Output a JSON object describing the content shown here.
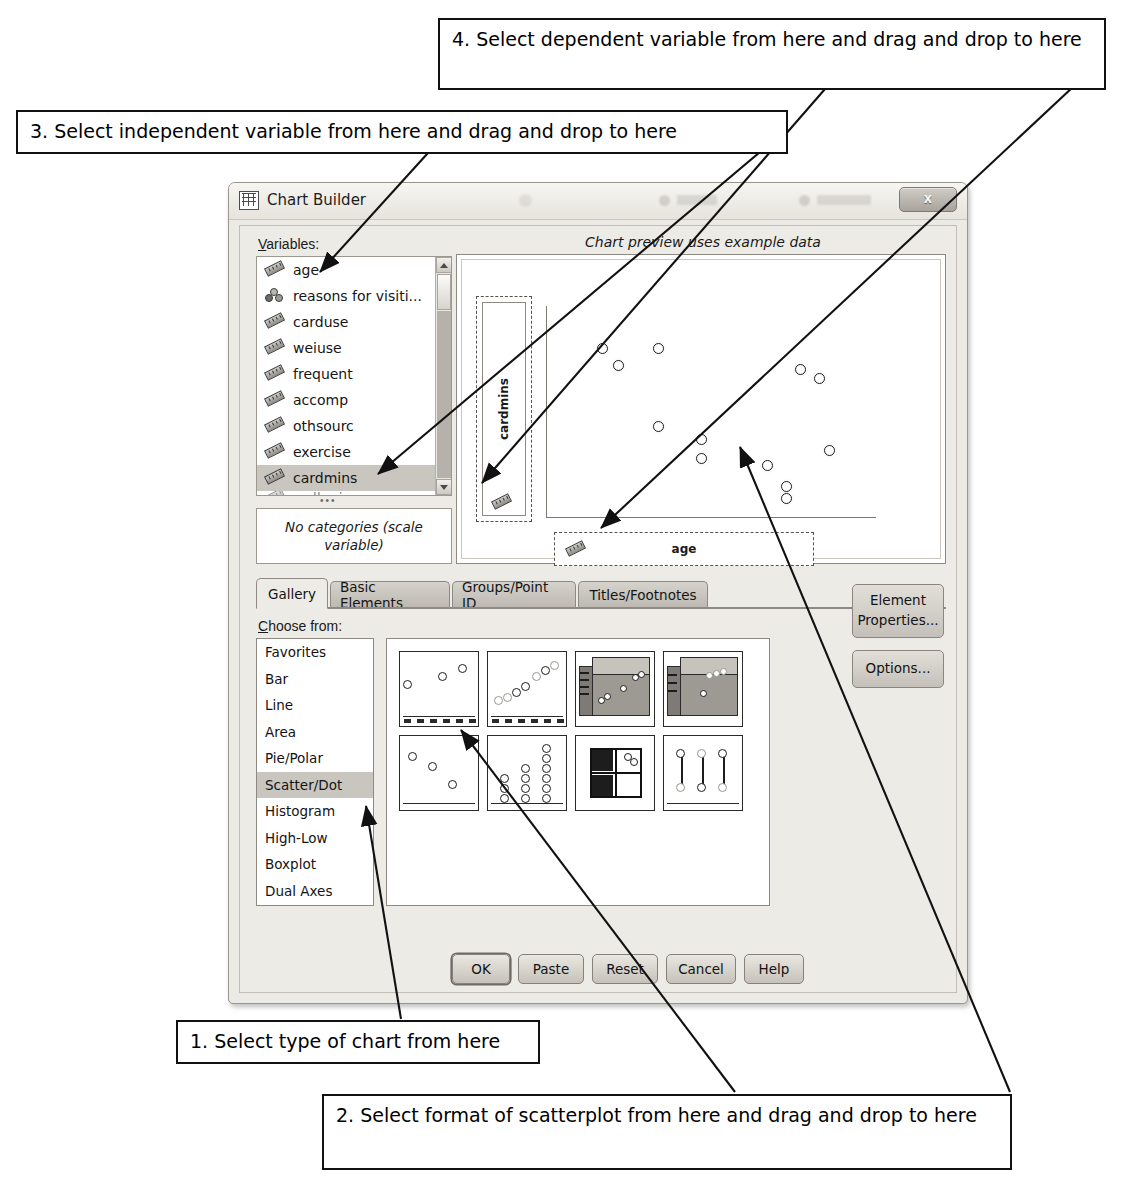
{
  "dialog": {
    "title": "Chart Builder",
    "title_icon": "grid-icon",
    "close_label": "x",
    "variables_label": "Variables:",
    "preview_caption": "Chart preview uses example data",
    "categories_note": "No categories (scale variable)",
    "choose_from_label": "Choose from:"
  },
  "variables": [
    {
      "name": "age",
      "icon": "scale-ruler-icon",
      "selected": false
    },
    {
      "name": "reasons for visiti...",
      "icon": "nominal-circles-icon",
      "selected": false
    },
    {
      "name": "carduse",
      "icon": "scale-ruler-icon",
      "selected": false
    },
    {
      "name": "weiuse",
      "icon": "scale-ruler-icon",
      "selected": false
    },
    {
      "name": "frequent",
      "icon": "scale-ruler-icon",
      "selected": false
    },
    {
      "name": "accomp",
      "icon": "scale-ruler-icon",
      "selected": false
    },
    {
      "name": "othsourc",
      "icon": "scale-ruler-icon",
      "selected": false
    },
    {
      "name": "exercise",
      "icon": "scale-ruler-icon",
      "selected": false
    },
    {
      "name": "cardmins",
      "icon": "scale-ruler-icon",
      "selected": true
    },
    {
      "name": "walkmins",
      "icon": "scale-ruler-icon",
      "selected": false
    }
  ],
  "tabs": [
    {
      "label": "Gallery",
      "active": true
    },
    {
      "label": "Basic Elements",
      "active": false
    },
    {
      "label": "Groups/Point ID",
      "active": false
    },
    {
      "label": "Titles/Footnotes",
      "active": false
    }
  ],
  "gallery_types": [
    {
      "label": "Favorites",
      "selected": false
    },
    {
      "label": "Bar",
      "selected": false
    },
    {
      "label": "Line",
      "selected": false
    },
    {
      "label": "Area",
      "selected": false
    },
    {
      "label": "Pie/Polar",
      "selected": false
    },
    {
      "label": "Scatter/Dot",
      "selected": true
    },
    {
      "label": "Histogram",
      "selected": false
    },
    {
      "label": "High-Low",
      "selected": false
    },
    {
      "label": "Boxplot",
      "selected": false
    },
    {
      "label": "Dual Axes",
      "selected": false
    }
  ],
  "gallery_thumbs": [
    {
      "name": "simple-scatter"
    },
    {
      "name": "grouped-scatter"
    },
    {
      "name": "3d-scatter"
    },
    {
      "name": "3d-grouped-scatter"
    },
    {
      "name": "scatter-matrix"
    },
    {
      "name": "simple-dot-plot"
    },
    {
      "name": "drop-line"
    },
    {
      "name": "1d-dot-plot"
    }
  ],
  "side_buttons": [
    {
      "label_line1": "Element",
      "label_line2": "Properties...",
      "name": "element-properties"
    },
    {
      "label_line1": "Options...",
      "label_line2": "",
      "name": "options"
    }
  ],
  "dialog_buttons": [
    {
      "label": "OK",
      "name": "ok"
    },
    {
      "label": "Paste",
      "name": "paste"
    },
    {
      "label": "Reset",
      "name": "reset"
    },
    {
      "label": "Cancel",
      "name": "cancel"
    },
    {
      "label": "Help",
      "name": "help"
    }
  ],
  "chart_data": {
    "type": "scatter",
    "title": "Chart preview uses example data",
    "xlabel": "age",
    "ylabel": "cardmins",
    "grid": false,
    "legend": null,
    "xlim": [
      0,
      100
    ],
    "ylim": [
      0,
      100
    ],
    "axis_ticks_shown": false,
    "points": [
      {
        "x": 17,
        "y": 80
      },
      {
        "x": 22,
        "y": 72
      },
      {
        "x": 34,
        "y": 80
      },
      {
        "x": 77,
        "y": 70
      },
      {
        "x": 83,
        "y": 66
      },
      {
        "x": 34,
        "y": 43
      },
      {
        "x": 47,
        "y": 37
      },
      {
        "x": 47,
        "y": 28
      },
      {
        "x": 86,
        "y": 32
      },
      {
        "x": 67,
        "y": 25
      },
      {
        "x": 73,
        "y": 15
      },
      {
        "x": 73,
        "y": 9
      }
    ]
  },
  "callouts": [
    {
      "id": 1,
      "text": "1. Select type of chart from here"
    },
    {
      "id": 2,
      "text": "2. Select format of scatterplot from here and drag and drop to here"
    },
    {
      "id": 3,
      "text": "3. Select independent variable from here and drag and drop to here"
    },
    {
      "id": 4,
      "text": "4. Select dependent variable from here and drag and drop to here"
    }
  ]
}
